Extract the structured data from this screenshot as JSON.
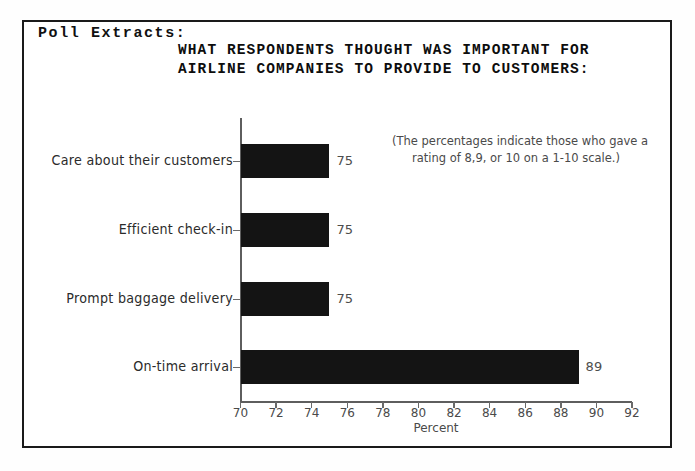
{
  "section_label": "Poll Extracts:",
  "title": {
    "line1": "WHAT RESPONDENTS THOUGHT WAS IMPORTANT FOR",
    "line2": "AIRLINE COMPANIES TO PROVIDE TO CUSTOMERS:"
  },
  "note": {
    "line1": "(The percentages indicate those who gave a",
    "line2": "rating of 8,9, or 10 on a 1-10 scale.)"
  },
  "chart_data": {
    "type": "bar",
    "orientation": "horizontal",
    "title": "WHAT RESPONDENTS THOUGHT WAS IMPORTANT FOR AIRLINE COMPANIES TO PROVIDE TO CUSTOMERS:",
    "categories": [
      "Care about their customers",
      "Efficient check-in",
      "Prompt baggage delivery",
      "On-time arrival"
    ],
    "values": [
      75,
      75,
      75,
      89
    ],
    "value_labels": [
      "75",
      "75",
      "75",
      "89"
    ],
    "xlabel": "Percent",
    "ylabel": "",
    "xlim": [
      70,
      92
    ],
    "xticks": [
      70,
      72,
      74,
      76,
      78,
      80,
      82,
      84,
      86,
      88,
      90,
      92
    ],
    "xtick_labels": [
      "70",
      "72",
      "74",
      "76",
      "78",
      "80",
      "82",
      "84",
      "86",
      "88",
      "90",
      "92"
    ],
    "grid": false,
    "legend": false,
    "bar_color": "#141414",
    "axis_color": "#5e5e5e",
    "annotation": "(The percentages indicate those who gave a rating of 8,9, or 10 on a 1-10 scale.)"
  }
}
